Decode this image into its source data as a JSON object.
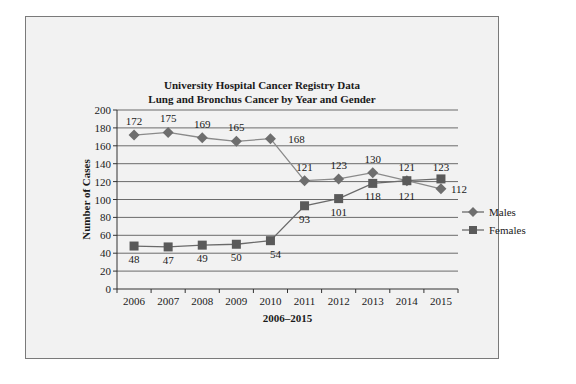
{
  "chart_data": {
    "type": "line",
    "title": "University Hospital Cancer Registry Data",
    "subtitle": "Lung and Bronchus Cancer by Year and Gender",
    "xlabel": "2006–2015",
    "ylabel": "Number of Cases",
    "ylim": [
      0,
      200
    ],
    "yticks": [
      0,
      20,
      40,
      60,
      80,
      100,
      120,
      140,
      160,
      180,
      200
    ],
    "grid": true,
    "legend_position": "right",
    "categories": [
      "2006",
      "2007",
      "2008",
      "2009",
      "2010",
      "2011",
      "2012",
      "2013",
      "2014",
      "2015"
    ],
    "series": [
      {
        "name": "Males",
        "marker": "diamond",
        "color": "#6e6e6e",
        "values": [
          172,
          175,
          169,
          165,
          168,
          121,
          123,
          130,
          121,
          112
        ]
      },
      {
        "name": "Females",
        "marker": "square",
        "color": "#5a5a5a",
        "values": [
          48,
          47,
          49,
          50,
          54,
          93,
          101,
          118,
          121,
          123
        ]
      }
    ]
  }
}
